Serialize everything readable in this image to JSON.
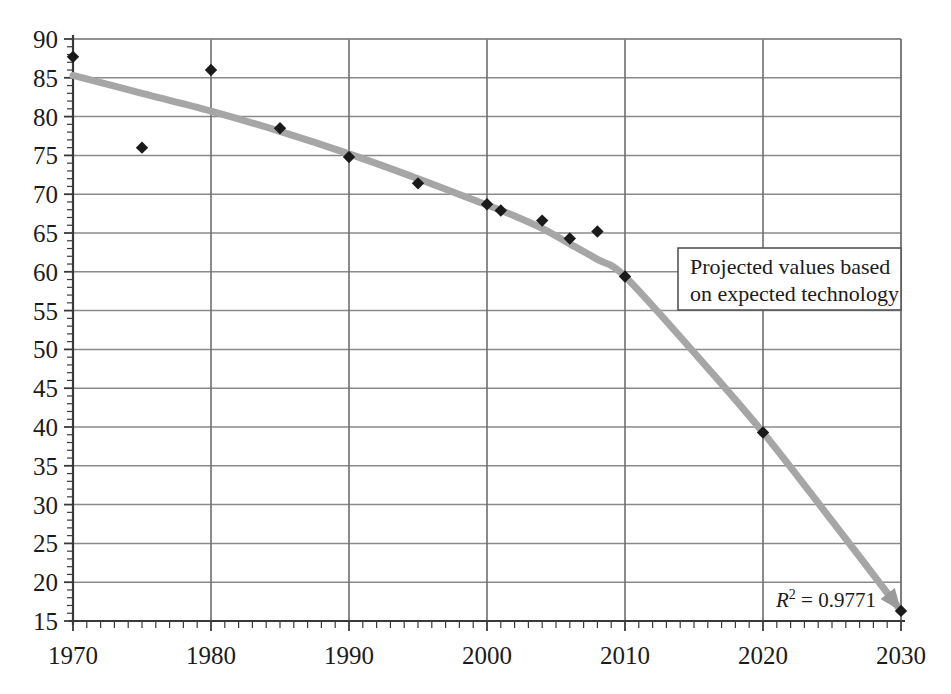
{
  "chart_data": {
    "type": "scatter",
    "title": "",
    "subtitle": "",
    "xlabel": "",
    "ylabel": "",
    "xlim": [
      1970,
      2030
    ],
    "ylim": [
      15,
      90
    ],
    "grid": true,
    "x_major_tick_labels": [
      "1970",
      "1980",
      "1990",
      "2000",
      "2010",
      "2020",
      "2030"
    ],
    "x_major_ticks": [
      1970,
      1980,
      1990,
      2000,
      2010,
      2020,
      2030
    ],
    "x_minor_tick_interval": 1,
    "y_tick_labels": [
      "90",
      "85",
      "80",
      "75",
      "70",
      "65",
      "60",
      "55",
      "50",
      "45",
      "40",
      "35",
      "30",
      "25",
      "20",
      "15"
    ],
    "y_ticks": [
      90,
      85,
      80,
      75,
      70,
      65,
      60,
      55,
      50,
      45,
      40,
      35,
      30,
      25,
      20,
      15
    ],
    "y_minor_tick_interval": 1,
    "legend_position": "none",
    "series": [
      {
        "name": "observed and projected points",
        "marker": "diamond",
        "marker_color": "#1a1a1a",
        "points": [
          {
            "x": 1970,
            "y": 87.7
          },
          {
            "x": 1975,
            "y": 76.0
          },
          {
            "x": 1980,
            "y": 86.0
          },
          {
            "x": 1985,
            "y": 78.5
          },
          {
            "x": 1990,
            "y": 74.8
          },
          {
            "x": 1995,
            "y": 71.4
          },
          {
            "x": 2000,
            "y": 68.7
          },
          {
            "x": 2001,
            "y": 67.9
          },
          {
            "x": 2004,
            "y": 66.6
          },
          {
            "x": 2006,
            "y": 64.3
          },
          {
            "x": 2008,
            "y": 65.2
          },
          {
            "x": 2010,
            "y": 59.4
          },
          {
            "x": 2020,
            "y": 39.3
          },
          {
            "x": 2030,
            "y": 16.3
          }
        ]
      },
      {
        "name": "trend curve",
        "marker": "none",
        "line_color": "#a6a6a6",
        "line_width": 7,
        "points": [
          {
            "x": 1970,
            "y": 85.3
          },
          {
            "x": 1975,
            "y": 83.0
          },
          {
            "x": 1980,
            "y": 80.7
          },
          {
            "x": 1985,
            "y": 78.1
          },
          {
            "x": 1990,
            "y": 75.2
          },
          {
            "x": 1995,
            "y": 72.0
          },
          {
            "x": 2000,
            "y": 68.6
          },
          {
            "x": 2002,
            "y": 67.2
          },
          {
            "x": 2004,
            "y": 65.6
          },
          {
            "x": 2006,
            "y": 63.6
          },
          {
            "x": 2008,
            "y": 61.6
          },
          {
            "x": 2010,
            "y": 59.4
          },
          {
            "x": 2015,
            "y": 49.6
          },
          {
            "x": 2020,
            "y": 39.3
          },
          {
            "x": 2025,
            "y": 27.9
          },
          {
            "x": 2030,
            "y": 16.3
          }
        ]
      }
    ],
    "annotations": [
      {
        "name": "projection-note",
        "line1": "Projected values based",
        "line2": "on expected technology",
        "boxed": true
      },
      {
        "name": "r-squared-label",
        "symbol": "R",
        "exponent": "2",
        "equals": "=",
        "value": "0.9771",
        "full_text": "R2 = 0.9771",
        "boxed": false
      }
    ]
  },
  "colors": {
    "axis": "#3a3a3a",
    "gridline": "#8a8a8a",
    "marker": "#1a1a1a",
    "trend": "#a6a6a6",
    "text": "#1b1b1b",
    "background": "#ffffff",
    "annotation_border": "#555555"
  }
}
